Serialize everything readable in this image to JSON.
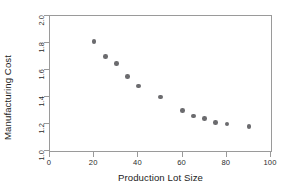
{
  "chart_data": {
    "type": "scatter",
    "title": "",
    "xlabel": "Production Lot Size",
    "ylabel": "Manufacturing Cost",
    "xlim": [
      0,
      100
    ],
    "ylim": [
      1.0,
      2.0
    ],
    "xticks": [
      "0",
      "20",
      "40",
      "60",
      "80",
      "100"
    ],
    "xtick_values": [
      0,
      20,
      40,
      60,
      80,
      100
    ],
    "yticks": [
      "1.0",
      "1.2",
      "1.4",
      "1.6",
      "1.8",
      "2.0"
    ],
    "ytick_values": [
      1.0,
      1.2,
      1.4,
      1.6,
      1.8,
      2.0
    ],
    "grid": false,
    "legend": null,
    "marker": {
      "shape": "circle",
      "color": "#6b6b6e",
      "size": 4.6
    },
    "frame_color": "#9a9a9a",
    "background": "#ffffff",
    "x": [
      20,
      25,
      30,
      35,
      40,
      50,
      60,
      65,
      70,
      75,
      80,
      90
    ],
    "y": [
      1.81,
      1.7,
      1.65,
      1.55,
      1.48,
      1.4,
      1.3,
      1.26,
      1.24,
      1.21,
      1.2,
      1.18
    ],
    "points": [
      {
        "x": 20,
        "y": 1.81
      },
      {
        "x": 25,
        "y": 1.7
      },
      {
        "x": 30,
        "y": 1.65
      },
      {
        "x": 35,
        "y": 1.55
      },
      {
        "x": 40,
        "y": 1.48
      },
      {
        "x": 50,
        "y": 1.4
      },
      {
        "x": 60,
        "y": 1.3
      },
      {
        "x": 65,
        "y": 1.26
      },
      {
        "x": 70,
        "y": 1.24
      },
      {
        "x": 75,
        "y": 1.21
      },
      {
        "x": 80,
        "y": 1.2
      },
      {
        "x": 90,
        "y": 1.18
      }
    ]
  }
}
